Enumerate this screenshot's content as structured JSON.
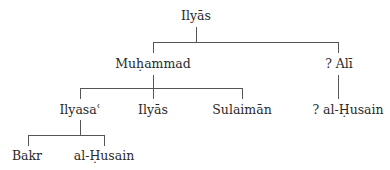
{
  "diagram": {
    "type": "family-tree",
    "nodes": {
      "root": "Ilyās",
      "muhammad": "Muḥammad",
      "ali": "? Alī",
      "ilyasa": "Ilyasaʿ",
      "ilyas2": "Ilyās",
      "sulaiman": "Sulaimān",
      "husain_ali": "? al-Ḥusain",
      "bakr": "Bakr",
      "husain": "al-Ḥusain"
    },
    "edges": [
      [
        "root",
        "muhammad"
      ],
      [
        "root",
        "ali"
      ],
      [
        "muhammad",
        "ilyasa"
      ],
      [
        "muhammad",
        "ilyas2"
      ],
      [
        "muhammad",
        "sulaiman"
      ],
      [
        "ali",
        "husain_ali"
      ],
      [
        "ilyasa",
        "bakr"
      ],
      [
        "ilyasa",
        "husain"
      ]
    ],
    "line_color": "#555555"
  }
}
